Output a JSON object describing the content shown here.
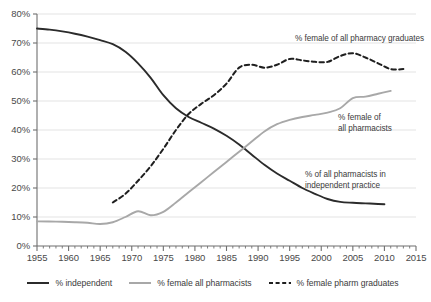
{
  "chart_data": {
    "type": "line",
    "title": "",
    "xlabel": "",
    "ylabel": "",
    "xlim": [
      1955,
      2015
    ],
    "ylim": [
      0,
      80
    ],
    "grid": true,
    "grid_axis": "y",
    "legend_position": "bottom",
    "x_major_step": 5,
    "x_minor_step": 1,
    "y_step": 10,
    "x_ticks": [
      "1955",
      "1960",
      "1965",
      "1970",
      "1975",
      "1980",
      "1985",
      "1990",
      "1995",
      "2000",
      "2005",
      "2010",
      "2015"
    ],
    "y_ticks": [
      "0%",
      "10%",
      "20%",
      "30%",
      "40%",
      "50%",
      "60%",
      "70%",
      "80%"
    ],
    "series": [
      {
        "name": "% independent",
        "legend_label": "% independent",
        "color": "#2b2b2b",
        "style": "solid",
        "annotation": "% of all pharmacists in independent practice",
        "x": [
          1955,
          1957,
          1959,
          1961,
          1963,
          1965,
          1967,
          1969,
          1971,
          1973,
          1975,
          1977,
          1979,
          1981,
          1983,
          1985,
          1987,
          1989,
          1991,
          1993,
          1995,
          1997,
          1999,
          2001,
          2003,
          2005,
          2007,
          2009,
          2010
        ],
        "values": [
          75.0,
          74.6,
          74.0,
          73.2,
          72.2,
          71.0,
          69.6,
          67.0,
          63.0,
          58.0,
          52.0,
          47.5,
          44.5,
          42.5,
          40.5,
          38.0,
          35.0,
          31.5,
          28.0,
          25.0,
          22.5,
          20.0,
          18.0,
          16.2,
          15.2,
          14.9,
          14.7,
          14.5,
          14.4
        ]
      },
      {
        "name": "% female all pharmacists",
        "legend_label": "% female all pharmacists",
        "color": "#a8a8a8",
        "style": "solid",
        "annotation": "% female of all pharmacists",
        "x": [
          1955,
          1958,
          1961,
          1963,
          1965,
          1967,
          1969,
          1971,
          1973,
          1975,
          1977,
          1979,
          1981,
          1983,
          1985,
          1987,
          1989,
          1991,
          1993,
          1995,
          1997,
          1999,
          2001,
          2003,
          2005,
          2007,
          2009,
          2011
        ],
        "values": [
          8.5,
          8.4,
          8.2,
          8.0,
          7.6,
          8.2,
          10.0,
          12.0,
          10.6,
          11.8,
          15.0,
          18.5,
          22.0,
          25.5,
          29.0,
          32.5,
          36.0,
          39.5,
          42.0,
          43.5,
          44.5,
          45.2,
          46.0,
          47.5,
          51.0,
          51.5,
          52.5,
          53.5
        ]
      },
      {
        "name": "% female pharm graduates",
        "legend_label": "% female pharm graduates",
        "color": "#1f1f1f",
        "style": "dashed",
        "annotation": "% female of all pharmacy graduates",
        "x": [
          1967,
          1969,
          1971,
          1973,
          1975,
          1977,
          1979,
          1981,
          1983,
          1985,
          1987,
          1989,
          1991,
          1993,
          1995,
          1997,
          1999,
          2001,
          2003,
          2005,
          2007,
          2009,
          2011,
          2013
        ],
        "values": [
          15.0,
          18.0,
          22.5,
          27.5,
          33.5,
          40.0,
          45.5,
          49.0,
          52.0,
          56.0,
          61.5,
          62.5,
          61.5,
          62.5,
          64.5,
          64.0,
          63.5,
          63.5,
          65.5,
          66.5,
          65.0,
          63.0,
          61.0,
          61.0
        ]
      }
    ],
    "annotations": [
      {
        "id": "annot-graduates",
        "text": "% female of all pharmacy graduates",
        "x": 1994,
        "y": 73
      },
      {
        "id": "annot-female-pharmacists",
        "text": "% female of\nall pharmacists",
        "x": 2007,
        "y": 48
      },
      {
        "id": "annot-independent",
        "text": "% of all pharmacists in\nindependent practice",
        "x": 2000,
        "y": 28
      }
    ]
  },
  "axes": {
    "y_labels": [
      "80%",
      "70%",
      "60%",
      "50%",
      "40%",
      "30%",
      "20%",
      "10%",
      "0%"
    ],
    "x_labels": [
      "1955",
      "1960",
      "1965",
      "1970",
      "1975",
      "1980",
      "1985",
      "1990",
      "1995",
      "2000",
      "2005",
      "2010",
      "2015"
    ]
  },
  "annotations": {
    "graduates": "% female of all pharmacy graduates",
    "female_pharmacists_line1": "% female of",
    "female_pharmacists_line2": "all pharmacists",
    "independent_line1": "% of all pharmacists in",
    "independent_line2": "independent practice"
  },
  "legend": {
    "items": [
      {
        "label": "% independent",
        "color": "#2b2b2b",
        "style": "solid"
      },
      {
        "label": "% female all pharmacists",
        "color": "#a8a8a8",
        "style": "solid"
      },
      {
        "label": "% female pharm graduates",
        "color": "#1f1f1f",
        "style": "dashed"
      }
    ]
  },
  "colors": {
    "independent": "#2b2b2b",
    "female_pharmacists": "#a8a8a8",
    "female_graduates": "#1f1f1f",
    "grid": "#e3e3e3",
    "axis": "#6f6f6f",
    "text": "#3b3b3b",
    "background": "#ffffff"
  }
}
